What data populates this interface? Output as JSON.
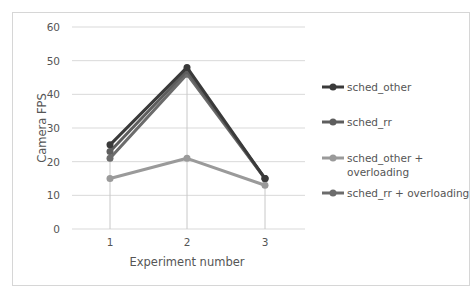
{
  "chart_data": {
    "type": "line",
    "title": "",
    "xlabel": "Experiment number",
    "ylabel": "Camera FPS",
    "x": [
      1,
      2,
      3
    ],
    "categories": [
      "1",
      "2",
      "3"
    ],
    "ylim": [
      0,
      60
    ],
    "yticks": [
      0,
      10,
      20,
      30,
      40,
      50,
      60
    ],
    "grid": {
      "horizontal": true,
      "vertical_drop_lines": true
    },
    "legend_position": "right",
    "series": [
      {
        "name": "sched_other",
        "values": [
          25,
          48,
          15
        ],
        "color": "#3a3a3a"
      },
      {
        "name": "sched_rr",
        "values": [
          23,
          47,
          15
        ],
        "color": "#5e5e5e"
      },
      {
        "name": "sched_other + overloading",
        "values": [
          15,
          21,
          13
        ],
        "color": "#9a9a9a"
      },
      {
        "name": "sched_rr + overloading",
        "values": [
          21,
          46,
          15
        ],
        "color": "#6c6c6c"
      }
    ]
  },
  "axes": {
    "y_tick_labels": [
      "0",
      "10",
      "20",
      "30",
      "40",
      "50",
      "60"
    ],
    "x_tick_labels": [
      "1",
      "2",
      "3"
    ],
    "xlabel": "Experiment number",
    "ylabel": "Camera FPS"
  },
  "legend": {
    "items": [
      {
        "line1": "sched_other",
        "line2": ""
      },
      {
        "line1": "sched_rr",
        "line2": ""
      },
      {
        "line1": "sched_other +",
        "line2": "overloading"
      },
      {
        "line1": "sched_rr + overloading",
        "line2": ""
      }
    ]
  }
}
